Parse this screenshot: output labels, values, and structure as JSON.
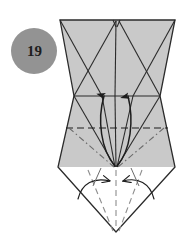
{
  "figure": {
    "kind": "origami-folding-diagram",
    "step_badge": {
      "number": "19",
      "shape": "circle",
      "fill_color": "#939393",
      "text_color": "#1d1d1d",
      "center_x": 34,
      "center_y": 51,
      "radius": 23
    },
    "canvas": {
      "width": 184,
      "height": 238,
      "background_color": "#ffffff"
    },
    "palette": {
      "paper_shaded": "#c9c9c9",
      "paper_shaded_light": "#cfcfcf",
      "paper_white": "#ffffff",
      "line_dark": "#2b2b2b",
      "line_mid": "#4a4a4a",
      "line_light": "#8d8d8d",
      "arrow_fill": "#1d1d1d"
    },
    "regions": [
      {
        "name": "upper-shaded-trapezoid",
        "fill": "#c9c9c9",
        "description": "wide shaded band across the top of the model"
      },
      {
        "name": "lower-shaded-trapezoid",
        "fill": "#c9c9c9",
        "description": "shaded band below the middle horizontal crease"
      },
      {
        "name": "bottom-white-triangle",
        "fill": "#ffffff",
        "description": "unshaded inverted triangle point at the bottom"
      }
    ],
    "creases": [
      {
        "name": "top-edge",
        "style": "solid"
      },
      {
        "name": "middle-horizontal-crease",
        "style": "solid"
      },
      {
        "name": "valley-horizontal-crease",
        "style": "dashed"
      },
      {
        "name": "mountain-diagonal-left",
        "style": "dash-dot"
      },
      {
        "name": "mountain-diagonal-right",
        "style": "dash-dot"
      },
      {
        "name": "bottom-valley-left",
        "style": "dashed"
      },
      {
        "name": "bottom-valley-right",
        "style": "dashed"
      },
      {
        "name": "center-vertical",
        "style": "solid"
      }
    ],
    "arrows": [
      {
        "name": "fold-up-arrow-left",
        "direction": "up",
        "style": "curved-solid-filled-head"
      },
      {
        "name": "fold-up-arrow-right",
        "direction": "up",
        "style": "curved-solid-filled-head"
      },
      {
        "name": "fold-in-arrow-left",
        "direction": "right",
        "style": "curved-open-head"
      },
      {
        "name": "fold-in-arrow-right",
        "direction": "left",
        "style": "curved-open-head"
      }
    ]
  }
}
